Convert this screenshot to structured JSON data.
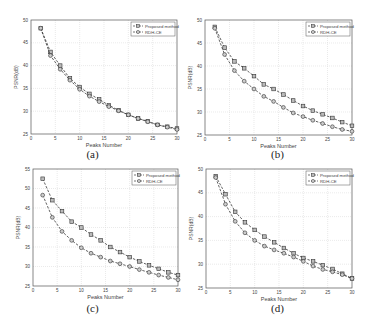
{
  "chart_data": [
    {
      "id": "a",
      "type": "line",
      "caption": "(a)",
      "xlabel": "Peaks Number",
      "ylabel": "PSNR(dB)",
      "xlim": [
        0,
        30
      ],
      "ylim": [
        25,
        50
      ],
      "xticks": [
        0,
        5,
        10,
        15,
        20,
        25,
        30
      ],
      "yticks": [
        25,
        30,
        35,
        40,
        45,
        50
      ],
      "grid": true,
      "legend_position": "top-right",
      "x": [
        2,
        4,
        6,
        8,
        10,
        12,
        14,
        16,
        18,
        20,
        22,
        24,
        26,
        28,
        30
      ],
      "series": [
        {
          "name": "Proposed method",
          "marker": "square",
          "values": [
            48.2,
            43.0,
            40.0,
            37.2,
            35.3,
            33.8,
            32.6,
            31.3,
            30.2,
            29.2,
            28.4,
            27.8,
            27.0,
            26.6,
            26.2
          ]
        },
        {
          "name": "RDH-CE",
          "marker": "circle",
          "values": [
            48.2,
            42.2,
            39.2,
            36.8,
            34.8,
            33.3,
            32.1,
            31.0,
            30.1,
            29.2,
            28.4,
            27.7,
            27.0,
            26.5,
            26.0
          ]
        }
      ]
    },
    {
      "id": "b",
      "type": "line",
      "caption": "(b)",
      "xlabel": "Peaks Number",
      "ylabel": "PSNR(dB)",
      "xlim": [
        0,
        30
      ],
      "ylim": [
        25,
        50
      ],
      "xticks": [
        0,
        5,
        10,
        15,
        20,
        25,
        30
      ],
      "yticks": [
        25,
        30,
        35,
        40,
        45,
        50
      ],
      "grid": true,
      "legend_position": "top-right",
      "x": [
        2,
        4,
        6,
        8,
        10,
        12,
        14,
        16,
        18,
        20,
        22,
        24,
        26,
        28,
        30
      ],
      "series": [
        {
          "name": "Proposed method",
          "marker": "square",
          "values": [
            48.5,
            44.0,
            41.0,
            39.5,
            37.8,
            36.0,
            35.0,
            33.8,
            32.5,
            31.3,
            30.3,
            29.5,
            28.7,
            27.8,
            27.0
          ]
        },
        {
          "name": "RDH-CE",
          "marker": "circle",
          "values": [
            48.2,
            42.5,
            39.0,
            36.7,
            35.0,
            33.4,
            32.3,
            31.0,
            29.8,
            29.0,
            28.2,
            27.5,
            26.8,
            26.2,
            25.8
          ]
        }
      ]
    },
    {
      "id": "c",
      "type": "line",
      "caption": "(c)",
      "xlabel": "Peaks Number",
      "ylabel": "PSNR(dB)",
      "xlim": [
        0,
        30
      ],
      "ylim": [
        25,
        55
      ],
      "xticks": [
        0,
        5,
        10,
        15,
        20,
        25,
        30
      ],
      "yticks": [
        25,
        30,
        35,
        40,
        45,
        50,
        55
      ],
      "grid": true,
      "legend_position": "top-right",
      "x": [
        2,
        4,
        6,
        8,
        10,
        12,
        14,
        16,
        18,
        20,
        22,
        24,
        26,
        28,
        30
      ],
      "series": [
        {
          "name": "Proposed method",
          "marker": "square",
          "values": [
            52.5,
            47.0,
            44.2,
            41.5,
            40.0,
            38.2,
            36.7,
            35.0,
            33.7,
            32.4,
            31.3,
            30.3,
            29.4,
            28.5,
            27.8
          ]
        },
        {
          "name": "RDH-CE",
          "marker": "circle",
          "values": [
            48.3,
            42.6,
            39.0,
            36.7,
            34.8,
            33.4,
            32.4,
            31.4,
            30.7,
            30.0,
            29.2,
            28.5,
            27.8,
            27.2,
            26.6
          ]
        }
      ]
    },
    {
      "id": "d",
      "type": "line",
      "caption": "(d)",
      "xlabel": "Peaks Number",
      "ylabel": "PSNR(dB)",
      "xlim": [
        0,
        30
      ],
      "ylim": [
        25,
        50
      ],
      "xticks": [
        0,
        5,
        10,
        15,
        20,
        25,
        30
      ],
      "yticks": [
        25,
        30,
        35,
        40,
        45,
        50
      ],
      "grid": true,
      "legend_position": "top-right",
      "x": [
        2,
        4,
        6,
        8,
        10,
        12,
        14,
        16,
        18,
        20,
        22,
        24,
        26,
        28,
        30
      ],
      "series": [
        {
          "name": "Proposed method",
          "marker": "square",
          "values": [
            48.5,
            44.7,
            41.0,
            38.8,
            37.2,
            35.8,
            34.6,
            33.4,
            32.3,
            31.3,
            30.6,
            29.8,
            29.0,
            28.0,
            27.0
          ]
        },
        {
          "name": "RDH-CE",
          "marker": "circle",
          "values": [
            48.2,
            42.6,
            39.0,
            36.6,
            35.0,
            33.8,
            33.0,
            32.3,
            31.5,
            30.6,
            29.6,
            28.9,
            28.4,
            27.8,
            27.0
          ]
        }
      ]
    }
  ],
  "panels": {
    "a": {
      "caption": "(a)"
    },
    "b": {
      "caption": "(b)"
    },
    "c": {
      "caption": "(c)"
    },
    "d": {
      "caption": "(d)"
    }
  },
  "colors": {
    "line": "#3a3a3a",
    "grid": "#dcdcdc",
    "axis": "#555555",
    "text": "#444444"
  }
}
